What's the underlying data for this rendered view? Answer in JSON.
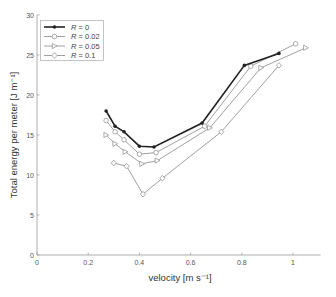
{
  "chart_data": {
    "type": "line",
    "title": "",
    "xlabel": "velocity [m s⁻¹]",
    "ylabel": "Total energy per meter [J m⁻¹]",
    "xlim": [
      0,
      1.1
    ],
    "ylim": [
      0,
      30
    ],
    "xticks": [
      0,
      0.2,
      0.4,
      0.6,
      0.8,
      1
    ],
    "xtick_labels": [
      "0",
      "0.2",
      "0.4",
      "0.6",
      "0.8",
      "1"
    ],
    "yticks": [
      0,
      5,
      10,
      15,
      20,
      25,
      30
    ],
    "ytick_labels": [
      "0",
      "5",
      "10",
      "15",
      "20",
      "25",
      "30"
    ],
    "grid": false,
    "legend_position": "upper left",
    "series": [
      {
        "name": "R = 0",
        "label_var": "R",
        "label_val": " = 0",
        "marker": "filled-dot",
        "color": "#222222",
        "line_width": 1.6,
        "x": [
          0.27,
          0.305,
          0.34,
          0.4,
          0.457,
          0.645,
          0.81,
          0.945
        ],
        "y": [
          18.0,
          16.1,
          15.4,
          13.6,
          13.5,
          16.5,
          23.7,
          25.2
        ]
      },
      {
        "name": "R = 0.02",
        "label_var": "R",
        "label_val": " = 0.02",
        "marker": "circle",
        "color": "#888888",
        "line_width": 0.8,
        "x": [
          0.27,
          0.305,
          0.34,
          0.4,
          0.465,
          0.655,
          0.835,
          1.01
        ],
        "y": [
          16.8,
          15.4,
          14.4,
          12.6,
          12.8,
          16.1,
          23.6,
          26.4
        ]
      },
      {
        "name": "R = 0.05",
        "label_var": "R",
        "label_val": " = 0.05",
        "marker": "triangle-right",
        "color": "#888888",
        "line_width": 0.8,
        "x": [
          0.27,
          0.305,
          0.345,
          0.41,
          0.47,
          0.675,
          0.875,
          1.05
        ],
        "y": [
          15.0,
          13.9,
          12.9,
          11.4,
          11.8,
          15.9,
          23.4,
          25.9
        ]
      },
      {
        "name": "R = 0.1",
        "label_var": "R",
        "label_val": " = 0.1",
        "marker": "diamond",
        "color": "#888888",
        "line_width": 0.8,
        "x": [
          0.3,
          0.35,
          0.414,
          0.49,
          0.72,
          0.945
        ],
        "y": [
          11.5,
          11.1,
          7.6,
          9.6,
          15.4,
          23.7
        ]
      }
    ]
  },
  "layout": {
    "plot_left": 37,
    "plot_right": 320.6,
    "plot_top": 15,
    "plot_bottom": 255,
    "px_per_x": 256,
    "px_per_y": 8
  }
}
